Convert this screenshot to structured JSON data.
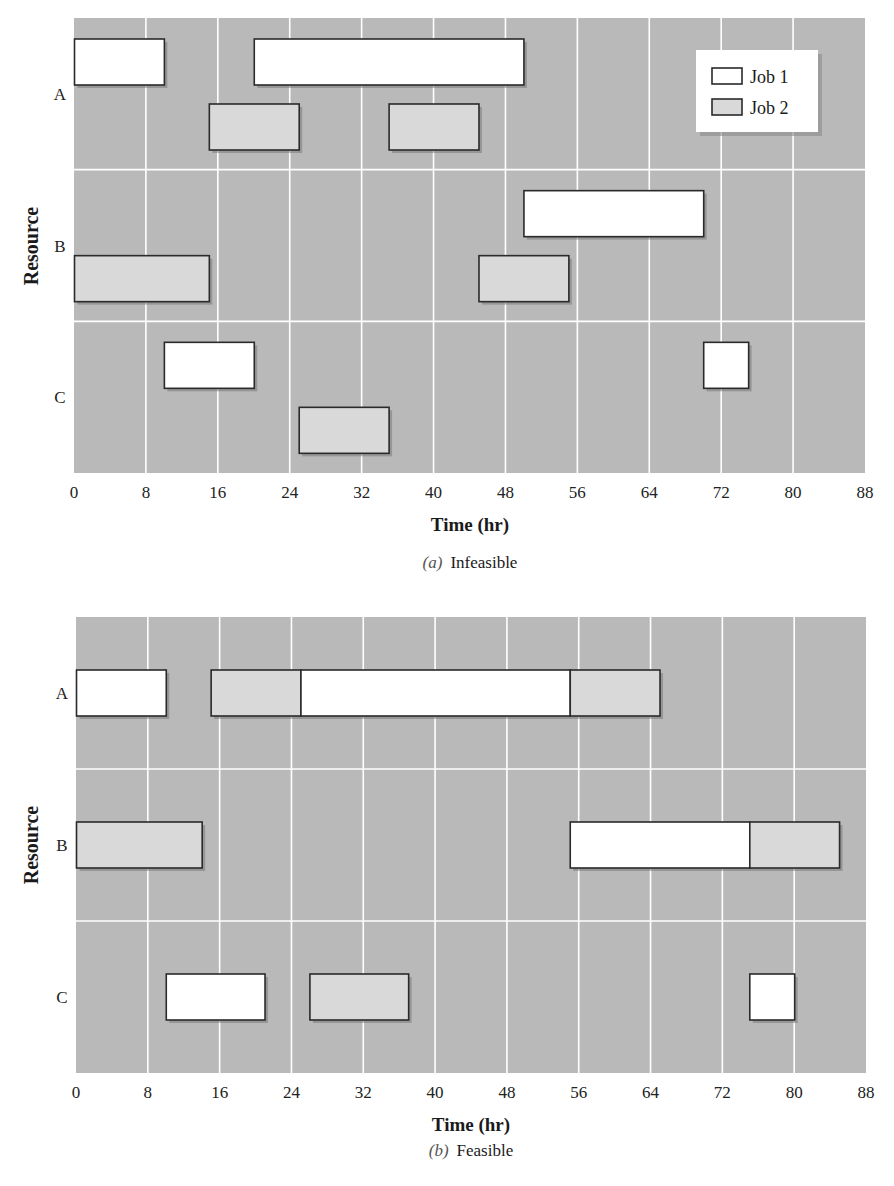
{
  "colors": {
    "plot_background": "#b9b9b9",
    "grid": "#ffffff",
    "job1_fill": "#ffffff",
    "job2_fill": "#d9d9d9",
    "bar_border": "#2a2a2a"
  },
  "chart_data": [
    {
      "type": "gantt",
      "id": "a",
      "caption_letter": "(a)",
      "caption_text": "Infeasible",
      "xlabel": "Time (hr)",
      "ylabel": "Resource",
      "xlim": [
        0,
        88
      ],
      "xticks": [
        "0",
        "8",
        "16",
        "24",
        "32",
        "40",
        "48",
        "56",
        "64",
        "72",
        "80",
        "88"
      ],
      "resources": [
        "A",
        "B",
        "C"
      ],
      "lanes": "per-job",
      "grid": true,
      "legend": {
        "placement": "top-right",
        "entries": [
          {
            "job": "Job 1",
            "label": "Job 1"
          },
          {
            "job": "Job 2",
            "label": "Job 2"
          }
        ]
      },
      "tasks": [
        {
          "resource": "A",
          "job": "Job 1",
          "start": 0,
          "end": 10
        },
        {
          "resource": "A",
          "job": "Job 1",
          "start": 20,
          "end": 50
        },
        {
          "resource": "A",
          "job": "Job 2",
          "start": 15,
          "end": 25
        },
        {
          "resource": "A",
          "job": "Job 2",
          "start": 35,
          "end": 45
        },
        {
          "resource": "B",
          "job": "Job 1",
          "start": 50,
          "end": 70
        },
        {
          "resource": "B",
          "job": "Job 2",
          "start": 0,
          "end": 15
        },
        {
          "resource": "B",
          "job": "Job 2",
          "start": 45,
          "end": 55
        },
        {
          "resource": "C",
          "job": "Job 1",
          "start": 10,
          "end": 20
        },
        {
          "resource": "C",
          "job": "Job 1",
          "start": 70,
          "end": 75
        },
        {
          "resource": "C",
          "job": "Job 2",
          "start": 25,
          "end": 35
        }
      ]
    },
    {
      "type": "gantt",
      "id": "b",
      "caption_letter": "(b)",
      "caption_text": "Feasible",
      "xlabel": "Time (hr)",
      "ylabel": "Resource",
      "xlim": [
        0,
        88
      ],
      "xticks": [
        "0",
        "8",
        "16",
        "24",
        "32",
        "40",
        "48",
        "56",
        "64",
        "72",
        "80",
        "88"
      ],
      "resources": [
        "A",
        "B",
        "C"
      ],
      "lanes": "single",
      "grid": true,
      "tasks": [
        {
          "resource": "A",
          "job": "Job 1",
          "start": 0,
          "end": 10
        },
        {
          "resource": "A",
          "job": "Job 2",
          "start": 15,
          "end": 25
        },
        {
          "resource": "A",
          "job": "Job 1",
          "start": 25,
          "end": 55
        },
        {
          "resource": "A",
          "job": "Job 2",
          "start": 55,
          "end": 65
        },
        {
          "resource": "B",
          "job": "Job 2",
          "start": 0,
          "end": 14
        },
        {
          "resource": "B",
          "job": "Job 1",
          "start": 55,
          "end": 75
        },
        {
          "resource": "B",
          "job": "Job 2",
          "start": 75,
          "end": 85
        },
        {
          "resource": "C",
          "job": "Job 1",
          "start": 10,
          "end": 21
        },
        {
          "resource": "C",
          "job": "Job 2",
          "start": 26,
          "end": 37
        },
        {
          "resource": "C",
          "job": "Job 1",
          "start": 75,
          "end": 80
        }
      ]
    }
  ]
}
